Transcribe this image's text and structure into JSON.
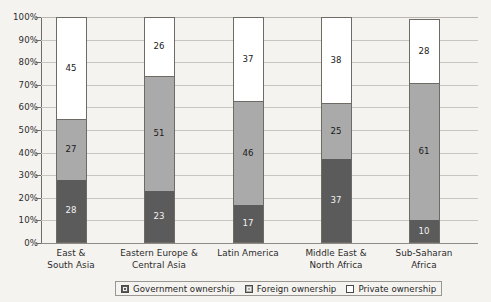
{
  "chart_data": {
    "type": "bar",
    "subtype": "stacked-bar-100",
    "title": "",
    "xlabel": "",
    "ylabel": "",
    "ylim": [
      0,
      100
    ],
    "grid": true,
    "legend_position": "bottom",
    "categories": [
      "East & South Asia",
      "Eastern Europe & Central Asia",
      "Latin America",
      "Middle East & North Africa",
      "Sub-Saharan Africa"
    ],
    "category_lines": [
      [
        "East &",
        "South Asia"
      ],
      [
        "Eastern Europe &",
        "Central Asia"
      ],
      [
        "Latin America",
        ""
      ],
      [
        "Middle East &",
        "North Africa"
      ],
      [
        "Sub-Saharan",
        "Africa"
      ]
    ],
    "series": [
      {
        "name": "Government ownership",
        "color": "#5b5b5b",
        "values": [
          28,
          23,
          17,
          37,
          10
        ]
      },
      {
        "name": "Foreign ownership",
        "color": "#aaaaaa",
        "values": [
          27,
          51,
          46,
          25,
          61
        ]
      },
      {
        "name": "Private ownership",
        "color": "#ffffff",
        "values": [
          45,
          26,
          37,
          38,
          28
        ]
      }
    ],
    "ytick_labels": [
      "100%",
      "90%",
      "80%",
      "70%",
      "60%",
      "50%",
      "40%",
      "30%",
      "20%",
      "10%",
      "0%"
    ],
    "ytick_values": [
      100,
      90,
      80,
      70,
      60,
      50,
      40,
      30,
      20,
      10,
      0
    ]
  },
  "legend": {
    "items": [
      {
        "label": "Government ownership",
        "swatch": "gov"
      },
      {
        "label": "Foreign ownership",
        "swatch": "for"
      },
      {
        "label": "Private ownership",
        "swatch": "priv"
      }
    ]
  },
  "colors": {
    "government": "#5b5b5b",
    "foreign": "#aaaaaa",
    "private": "#ffffff",
    "background": "#f5f3f0",
    "axis": "#6e6b67",
    "grid": "#c9c6c2"
  }
}
